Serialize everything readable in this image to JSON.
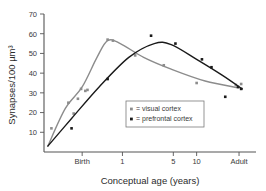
{
  "chart_data": {
    "type": "line",
    "title": "",
    "subtitle": "",
    "xlabel": "Conceptual age (years)",
    "ylabel": "Synapses/100 µm³",
    "grid": false,
    "legend_position": "center",
    "ylim": [
      0,
      70
    ],
    "yticks": [
      10,
      20,
      30,
      40,
      50,
      60,
      70
    ],
    "ytick_labels": [
      "10",
      "20",
      "30",
      "40",
      "50",
      "60",
      "70"
    ],
    "xticks": [
      0.18,
      0.37,
      0.61,
      0.72,
      0.92
    ],
    "xtick_labels": [
      "Birth",
      "1",
      "5",
      "10",
      "Adult"
    ],
    "x_axis_note": "log-like developmental scale; tick fractions are positions across plot width",
    "series": [
      {
        "name": "visual cortex",
        "color": "#8c8c8c",
        "marker": "square",
        "points": [
          {
            "x": 0.035,
            "y": 12
          },
          {
            "x": 0.115,
            "y": 25
          },
          {
            "x": 0.14,
            "y": 19.5
          },
          {
            "x": 0.16,
            "y": 27
          },
          {
            "x": 0.175,
            "y": 32
          },
          {
            "x": 0.195,
            "y": 31
          },
          {
            "x": 0.205,
            "y": 31.5
          },
          {
            "x": 0.3,
            "y": 57
          },
          {
            "x": 0.325,
            "y": 56.5
          },
          {
            "x": 0.43,
            "y": 49
          },
          {
            "x": 0.565,
            "y": 44
          },
          {
            "x": 0.72,
            "y": 35
          },
          {
            "x": 0.905,
            "y": 34
          },
          {
            "x": 0.93,
            "y": 34.5
          }
        ],
        "curve": [
          {
            "x": 0.018,
            "y": 3
          },
          {
            "x": 0.1,
            "y": 22
          },
          {
            "x": 0.18,
            "y": 33
          },
          {
            "x": 0.25,
            "y": 48
          },
          {
            "x": 0.3,
            "y": 56.5
          },
          {
            "x": 0.36,
            "y": 55
          },
          {
            "x": 0.47,
            "y": 48
          },
          {
            "x": 0.6,
            "y": 42
          },
          {
            "x": 0.76,
            "y": 36
          },
          {
            "x": 0.92,
            "y": 32.5
          }
        ]
      },
      {
        "name": "prefrontal cortex",
        "color": "#1a1a1a",
        "marker": "square",
        "points": [
          {
            "x": 0.13,
            "y": 12
          },
          {
            "x": 0.3,
            "y": 37
          },
          {
            "x": 0.505,
            "y": 59
          },
          {
            "x": 0.62,
            "y": 55
          },
          {
            "x": 0.745,
            "y": 47
          },
          {
            "x": 0.79,
            "y": 43
          },
          {
            "x": 0.855,
            "y": 28
          },
          {
            "x": 0.915,
            "y": 33
          },
          {
            "x": 0.93,
            "y": 32
          }
        ],
        "curve": [
          {
            "x": 0.018,
            "y": 3
          },
          {
            "x": 0.13,
            "y": 17
          },
          {
            "x": 0.26,
            "y": 33
          },
          {
            "x": 0.4,
            "y": 48
          },
          {
            "x": 0.52,
            "y": 55
          },
          {
            "x": 0.6,
            "y": 54.5
          },
          {
            "x": 0.72,
            "y": 47
          },
          {
            "x": 0.84,
            "y": 39
          },
          {
            "x": 0.935,
            "y": 32
          }
        ]
      }
    ],
    "legend": [
      {
        "label": "= visual cortex",
        "color": "#8c8c8c"
      },
      {
        "label": "= prefrontal cortex",
        "color": "#1a1a1a"
      }
    ]
  }
}
